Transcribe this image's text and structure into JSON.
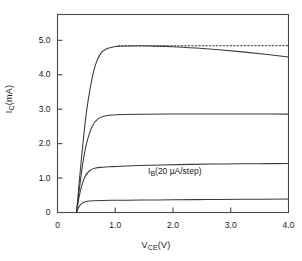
{
  "chart_data": {
    "type": "line",
    "title": "",
    "xlabel": "V_CE (V)",
    "ylabel": "I_C (mA)",
    "xlim": [
      0,
      4.0
    ],
    "ylim": [
      0,
      5.75
    ],
    "grid": false,
    "legend": "none",
    "annotations": [
      {
        "text": "I_B(20 µA/step)",
        "x": 1.85,
        "y": 1.05
      }
    ],
    "xticks": [
      "0",
      "1.0",
      "2.0",
      "3.0",
      "4.0"
    ],
    "xtick_values": [
      0,
      1.0,
      2.0,
      3.0,
      4.0
    ],
    "yticks": [
      "0",
      "1.0",
      "2.0",
      "3.0",
      "4.0",
      "5.0"
    ],
    "ytick_values": [
      0,
      1.0,
      2.0,
      3.0,
      4.0,
      5.0
    ],
    "series": [
      {
        "name": "I_B = 20 uA",
        "style": "solid",
        "x": [
          0.33,
          0.36,
          0.4,
          0.45,
          0.52,
          0.62,
          0.75,
          0.95,
          1.2,
          1.6,
          2.0,
          2.6,
          3.2,
          4.0
        ],
        "values": [
          0.0,
          0.13,
          0.23,
          0.29,
          0.325,
          0.34,
          0.348,
          0.353,
          0.357,
          0.363,
          0.368,
          0.376,
          0.383,
          0.392
        ]
      },
      {
        "name": "I_B = 40 uA",
        "style": "solid",
        "x": [
          0.33,
          0.37,
          0.42,
          0.48,
          0.56,
          0.66,
          0.78,
          0.92,
          1.1,
          1.4,
          1.8,
          2.3,
          2.9,
          3.5,
          4.0
        ],
        "values": [
          0.0,
          0.42,
          0.78,
          1.05,
          1.22,
          1.29,
          1.315,
          1.33,
          1.345,
          1.362,
          1.381,
          1.398,
          1.41,
          1.418,
          1.425
        ]
      },
      {
        "name": "I_B = 60 uA",
        "style": "solid",
        "x": [
          0.33,
          0.38,
          0.44,
          0.51,
          0.6,
          0.7,
          0.82,
          0.95,
          1.15,
          1.5,
          1.9,
          2.4,
          3.0,
          3.5,
          4.0
        ],
        "values": [
          0.0,
          0.7,
          1.45,
          2.05,
          2.5,
          2.72,
          2.8,
          2.83,
          2.845,
          2.855,
          2.86,
          2.862,
          2.862,
          2.86,
          2.857
        ]
      },
      {
        "name": "I_B = 80 uA",
        "style": "solid",
        "x": [
          0.33,
          0.38,
          0.44,
          0.5,
          0.57,
          0.65,
          0.74,
          0.84,
          0.95,
          1.05,
          1.2,
          1.4,
          1.7,
          2.0,
          2.4,
          2.8,
          3.2,
          3.6,
          4.0
        ],
        "values": [
          0.0,
          0.95,
          2.0,
          2.9,
          3.65,
          4.25,
          4.6,
          4.75,
          4.8,
          4.825,
          4.835,
          4.84,
          4.832,
          4.815,
          4.775,
          4.725,
          4.665,
          4.595,
          4.515
        ]
      },
      {
        "name": "ideal (no Early effect)",
        "style": "dotted",
        "x": [
          1.05,
          4.0
        ],
        "values": [
          4.838,
          4.845
        ]
      }
    ]
  },
  "axes": {
    "ylabel_main": "I",
    "ylabel_sub": "C",
    "ylabel_unit": "(mA)",
    "xlabel_main": "V",
    "xlabel_sub": "CE",
    "xlabel_unit": "(V)"
  },
  "annotation": {
    "main": "I",
    "sub": "B",
    "rest": "(20 µA/step)"
  },
  "style": {
    "line_color": "#3a3a3a",
    "frame_color": "#4a4a4a",
    "text_color": "#1a1a1a",
    "background": "#ffffff"
  }
}
